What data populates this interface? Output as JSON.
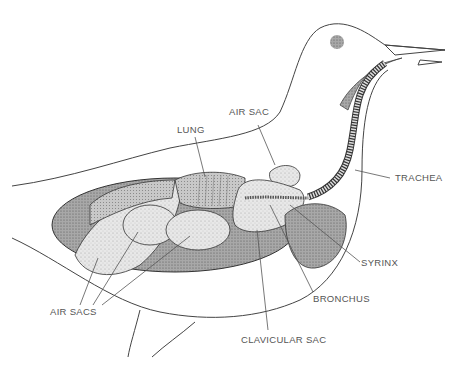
{
  "diagram": {
    "labels": {
      "air_sac": "AIR SAC",
      "lung": "LUNG",
      "trachea": "TRACHEA",
      "syrinx": "SYRINX",
      "bronchus": "BRONCHUS",
      "clavicular_sac": "CLAVICULAR SAC",
      "air_sacs": "AIR SACS"
    },
    "colors": {
      "outline": "#333333",
      "organ_fill": "#e6e6e6",
      "dark_fill": "#9a9a9a",
      "label_text": "#555555"
    }
  }
}
